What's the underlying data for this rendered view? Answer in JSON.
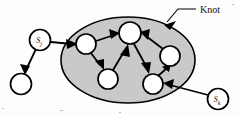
{
  "figure": {
    "background_color": "#fdfdfc",
    "width": 242,
    "height": 115
  },
  "annotations": [
    {
      "id": "knot-callout",
      "label": "Knot",
      "text_x": 200,
      "text_y": 13,
      "leader": {
        "x1": 196,
        "y1": 9,
        "x2": 178,
        "y2": 9,
        "x3": 167,
        "y3": 22
      },
      "arrow": {
        "x": 167,
        "y": 22,
        "angle_deg": 130
      }
    }
  ],
  "knot": {
    "name": "knot-region",
    "shape": "ellipse",
    "cx": 128,
    "cy": 60,
    "rx": 67,
    "ry": 43,
    "fill_color": "#c9c9c9",
    "stroke_color": "#000000"
  },
  "nodes": [
    {
      "id": "sj",
      "name": "node-sj",
      "cx": 40,
      "cy": 40,
      "r": 10.5,
      "label": "S",
      "sub": "j",
      "inside_knot": false
    },
    {
      "id": "n0",
      "name": "node-external",
      "cx": 21,
      "cy": 84,
      "r": 10.5,
      "label": "",
      "sub": "",
      "inside_knot": false
    },
    {
      "id": "a",
      "name": "node-a",
      "cx": 86,
      "cy": 44,
      "r": 10.0,
      "label": "",
      "sub": "",
      "inside_knot": true
    },
    {
      "id": "b",
      "name": "node-b",
      "cx": 130,
      "cy": 33,
      "r": 11.0,
      "label": "",
      "sub": "",
      "inside_knot": true
    },
    {
      "id": "c",
      "name": "node-c",
      "cx": 108,
      "cy": 79,
      "r": 10.0,
      "label": "",
      "sub": "",
      "inside_knot": true
    },
    {
      "id": "d",
      "name": "node-d",
      "cx": 170,
      "cy": 56,
      "r": 10.0,
      "label": "",
      "sub": "",
      "inside_knot": true
    },
    {
      "id": "e",
      "name": "node-e",
      "cx": 153,
      "cy": 84,
      "r": 10.0,
      "label": "",
      "sub": "",
      "inside_knot": true
    },
    {
      "id": "sk",
      "name": "node-sk",
      "cx": 218,
      "cy": 99,
      "r": 10.5,
      "label": "S",
      "sub": "k",
      "inside_knot": false
    }
  ],
  "edges": [
    {
      "id": "sj-n0",
      "name": "edge-sj-to-external",
      "from": "sj",
      "to": "n0",
      "directed": true
    },
    {
      "id": "sj-a",
      "name": "edge-sj-to-a",
      "from": "sj",
      "to": "a",
      "directed": true
    },
    {
      "id": "a-b",
      "name": "edge-a-to-b",
      "from": "a",
      "to": "b",
      "directed": true
    },
    {
      "id": "a-c",
      "name": "edge-a-to-c",
      "from": "a",
      "to": "c",
      "directed": true
    },
    {
      "id": "c-b",
      "name": "edge-c-to-b",
      "from": "c",
      "to": "b",
      "directed": true
    },
    {
      "id": "b-e",
      "name": "edge-b-to-e",
      "from": "b",
      "to": "e",
      "directed": true
    },
    {
      "id": "d-b",
      "name": "edge-d-to-b",
      "from": "d",
      "to": "b",
      "directed": true
    },
    {
      "id": "e-d",
      "name": "edge-e-to-d",
      "from": "e",
      "to": "d",
      "directed": true
    },
    {
      "id": "sk-e",
      "name": "edge-sk-to-e",
      "from": "sk",
      "to": "e",
      "directed": true
    }
  ]
}
